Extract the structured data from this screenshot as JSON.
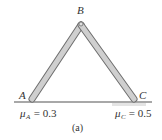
{
  "diagram": {
    "type": "statics-frame",
    "points": {
      "A": {
        "label": "A",
        "x": 32,
        "y": 100
      },
      "B": {
        "label": "B",
        "x": 81,
        "y": 24
      },
      "C": {
        "label": "C",
        "x": 134,
        "y": 100
      }
    },
    "members": [
      {
        "from": "A",
        "to": "B"
      },
      {
        "from": "B",
        "to": "C"
      }
    ],
    "friction": {
      "A": {
        "symbol": "μ",
        "subscript": "A",
        "equals": " = 0.3"
      },
      "C": {
        "symbol": "μ",
        "subscript": "C",
        "equals": " = 0.5"
      }
    },
    "caption": "(a)",
    "colors": {
      "member_fill": "#c8c8c8",
      "member_stroke": "#6e6e6e",
      "ground": "#9a9a9a",
      "text": "#333333"
    }
  }
}
